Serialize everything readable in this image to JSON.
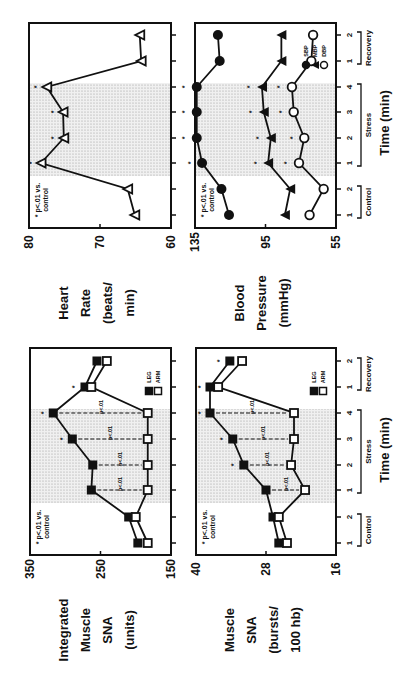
{
  "figure": {
    "orientation": "rotated -90 degrees",
    "x_axis": {
      "title": "Time (min)",
      "groups": [
        {
          "label": "Control",
          "ticks": [
            "1",
            "2"
          ]
        },
        {
          "label": "Stress",
          "ticks": [
            "1",
            "2",
            "3",
            "4"
          ]
        },
        {
          "label": "Recovery",
          "ticks": [
            "1",
            "2"
          ]
        }
      ]
    },
    "significance_note": "* p<.01 vs. control",
    "significance_note_line1": "* p<.01 vs.",
    "significance_note_line2": "control",
    "pair_note": "p<.01"
  },
  "chart_data": [
    {
      "type": "line",
      "title": "Integrated Muscle SNA",
      "ylabel": "Integrated Muscle SNA (units)",
      "ylabel_lines": [
        "Integrated",
        "Muscle",
        "SNA",
        "(units)"
      ],
      "xlabel": "Time (min)",
      "categories": [
        "Control 1",
        "Control 2",
        "Stress 1",
        "Stress 2",
        "Stress 3",
        "Stress 4",
        "Recovery 1",
        "Recovery 2"
      ],
      "ylim": [
        150,
        350
      ],
      "yticks": [
        "350",
        "250",
        "150"
      ],
      "shaded_region": "Stress 1-4",
      "legend": [
        "LEG",
        "ARM"
      ],
      "series": [
        {
          "name": "LEG",
          "marker": "filled-square",
          "values": [
            197,
            210,
            263,
            261,
            290,
            317,
            272,
            255
          ]
        },
        {
          "name": "ARM",
          "marker": "open-square",
          "values": [
            183,
            200,
            183,
            183,
            183,
            183,
            263,
            241
          ]
        }
      ],
      "annotations": [
        "* p<.01 vs. control",
        "p<.01 LEG vs ARM at Stress 1-4",
        "* at Stress 3, Stress 4, Recovery 1"
      ]
    },
    {
      "type": "line",
      "title": "Muscle SNA",
      "ylabel": "Muscle SNA (bursts/100 hb)",
      "ylabel_lines": [
        "Muscle",
        "SNA",
        "(bursts/",
        "100 hb)"
      ],
      "xlabel": "Time (min)",
      "categories": [
        "Control 1",
        "Control 2",
        "Stress 1",
        "Stress 2",
        "Stress 3",
        "Stress 4",
        "Recovery 1",
        "Recovery 2"
      ],
      "ylim": [
        16,
        40
      ],
      "yticks": [
        "40",
        "28",
        "16"
      ],
      "shaded_region": "Stress 1-4",
      "legend": [
        "LEG",
        "ARM"
      ],
      "series": [
        {
          "name": "LEG",
          "marker": "filled-square",
          "values": [
            25.8,
            26.8,
            28.0,
            31.8,
            33.7,
            37.6,
            37.6,
            34.2
          ]
        },
        {
          "name": "ARM",
          "marker": "open-square",
          "values": [
            24.4,
            25.8,
            21.3,
            23.7,
            23.2,
            23.2,
            36.2,
            32.1
          ]
        }
      ],
      "annotations": [
        "* p<.01 vs. control",
        "p<.01 LEG vs ARM at Stress 1-4"
      ]
    },
    {
      "type": "line",
      "title": "Heart Rate",
      "ylabel": "Heart Rate (beats/min)",
      "ylabel_lines": [
        "Heart",
        "Rate",
        "(beats/",
        "min)"
      ],
      "xlabel": "Time (min)",
      "categories": [
        "Control 1",
        "Control 2",
        "Stress 1",
        "Stress 2",
        "Stress 3",
        "Stress 4",
        "Recovery 1",
        "Recovery 2"
      ],
      "ylim": [
        60,
        80
      ],
      "yticks": [
        "80",
        "70",
        "60"
      ],
      "shaded_region": "Stress 1-4",
      "series": [
        {
          "name": "HR",
          "marker": "open-triangle",
          "values": [
            65.1,
            66.1,
            78.3,
            75.1,
            75.2,
            77.5,
            64.2,
            64.4
          ]
        }
      ],
      "annotations": [
        "* p<.01 vs. control at Stress 1-4"
      ]
    },
    {
      "type": "line",
      "title": "Blood Pressure",
      "ylabel": "Blood Pressure (mmHg)",
      "ylabel_lines": [
        "Blood",
        "Pressure",
        "(mmHg)"
      ],
      "xlabel": "Time (min)",
      "categories": [
        "Control 1",
        "Control 2",
        "Stress 1",
        "Stress 2",
        "Stress 3",
        "Stress 4",
        "Recovery 1",
        "Recovery 2"
      ],
      "ylim": [
        55,
        135
      ],
      "yticks": [
        "135",
        "95",
        "55"
      ],
      "shaded_region": "Stress 1-4",
      "legend": [
        "SBP",
        "MBP",
        "DBP"
      ],
      "series": [
        {
          "name": "SBP",
          "marker": "filled-circle",
          "values": [
            115.7,
            120,
            131,
            134,
            134,
            134,
            121,
            122
          ]
        },
        {
          "name": "MBP",
          "marker": "filled-triangle",
          "values": [
            84,
            81,
            93.5,
            92,
            96,
            97,
            86,
            86
          ]
        },
        {
          "name": "DBP",
          "marker": "open-circle",
          "values": [
            70,
            62,
            76,
            73,
            79,
            80,
            69,
            68
          ]
        }
      ],
      "annotations": [
        "* p<.01 vs. control at Stress 1-4 for SBP, MBP, DBP"
      ]
    }
  ]
}
